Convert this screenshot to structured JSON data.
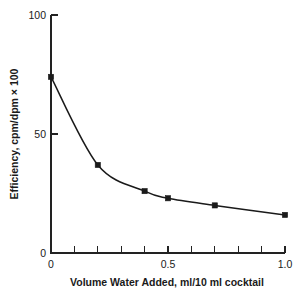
{
  "chart_data": {
    "type": "line",
    "title": "",
    "subtitle": "",
    "xlabel": "Volume Water Added, ml/10 ml cocktail",
    "ylabel": "Efficiency, cpm/dpm × 100",
    "xlim": [
      0,
      1.0
    ],
    "ylim": [
      0,
      100
    ],
    "grid": false,
    "legend": null,
    "x_tick_values": [
      0,
      0.1,
      0.2,
      0.3,
      0.4,
      0.5,
      0.6,
      0.7,
      0.8,
      0.9,
      1.0
    ],
    "x_tick_labels": [
      "0",
      "",
      "",
      "",
      "",
      "0.5",
      "",
      "",
      "",
      "",
      "1.0"
    ],
    "y_tick_values": [
      0,
      50,
      100
    ],
    "y_tick_labels": [
      "0",
      "50",
      "100"
    ],
    "x": [
      0,
      0.2,
      0.4,
      0.5,
      0.7,
      1.0
    ],
    "values": [
      74,
      37,
      26,
      23,
      20,
      16
    ],
    "series": [
      {
        "name": "Efficiency",
        "x": [
          0,
          0.2,
          0.4,
          0.5,
          0.7,
          1.0
        ],
        "values": [
          74,
          37,
          26,
          23,
          20,
          16
        ],
        "marker": "filled-square",
        "color": "#1a1a1a"
      }
    ],
    "annotations": []
  },
  "axes": {
    "x_label": "Volume Water Added, ml/10 ml cocktail",
    "y_label": "Efficiency, cpm/dpm × 100",
    "x_ticks": [
      {
        "value": 0,
        "label": "0"
      },
      {
        "value": 0.1,
        "label": ""
      },
      {
        "value": 0.2,
        "label": ""
      },
      {
        "value": 0.3,
        "label": ""
      },
      {
        "value": 0.4,
        "label": ""
      },
      {
        "value": 0.5,
        "label": "0.5"
      },
      {
        "value": 0.6,
        "label": ""
      },
      {
        "value": 0.7,
        "label": ""
      },
      {
        "value": 0.8,
        "label": ""
      },
      {
        "value": 0.9,
        "label": ""
      },
      {
        "value": 1.0,
        "label": "1.0"
      }
    ],
    "y_ticks": [
      {
        "value": 0,
        "label": "0"
      },
      {
        "value": 50,
        "label": "50"
      },
      {
        "value": 100,
        "label": "100"
      }
    ]
  },
  "style": {
    "line_color": "#1a1a1a",
    "marker_color": "#1a1a1a",
    "axis_color": "#222222",
    "text_color": "#1a1a1a",
    "background": "#ffffff"
  }
}
